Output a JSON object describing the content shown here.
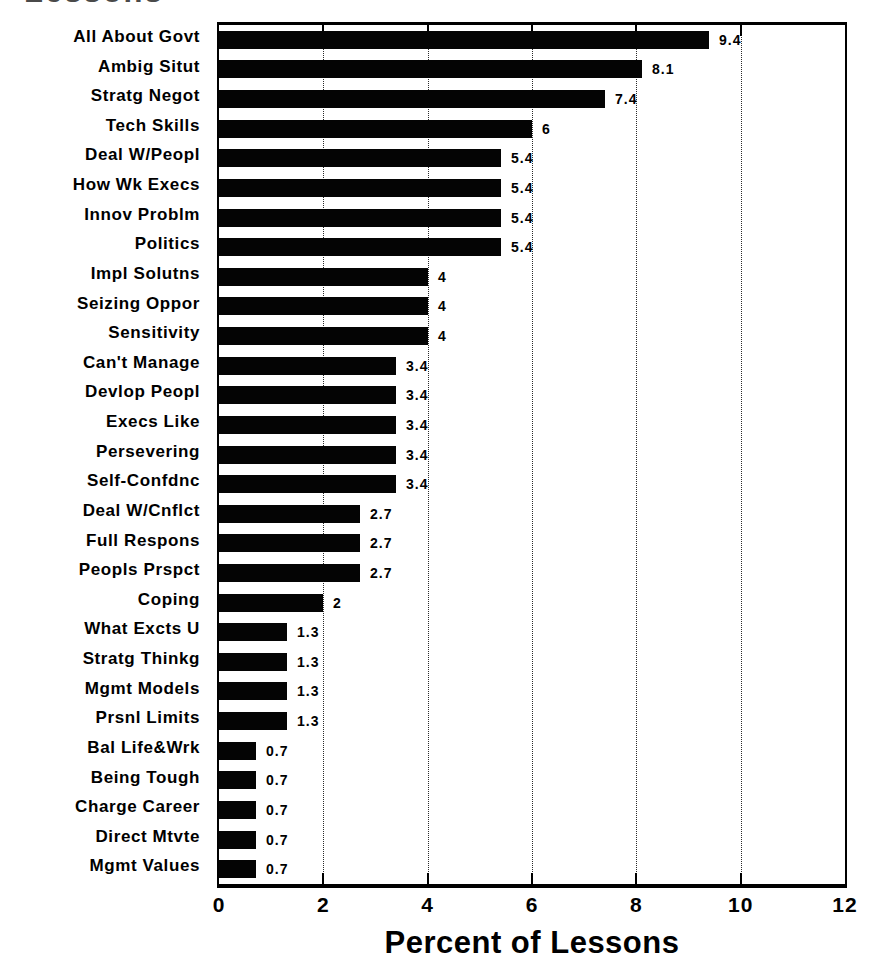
{
  "chart_data": {
    "type": "bar",
    "orientation": "horizontal",
    "title": "Lessons",
    "xlabel": "Percent of Lessons",
    "ylabel": "",
    "xlim": [
      0,
      12
    ],
    "x_ticks": [
      "0",
      "2",
      "4",
      "6",
      "8",
      "10",
      "12"
    ],
    "x_tick_values": [
      0,
      2,
      4,
      6,
      8,
      10,
      12
    ],
    "gridline_values": [
      2,
      4,
      6,
      8,
      10
    ],
    "grid": true,
    "legend": "none",
    "bar_color": "#040404",
    "background_color": "#ffffff",
    "text_color": "#000000",
    "categories": [
      "All About Govt",
      "Ambig Situt",
      "Stratg Negot",
      "Tech Skills",
      "Deal W/Peopl",
      "How Wk Execs",
      "Innov Problm",
      "Politics",
      "Impl Solutns",
      "Seizing Oppor",
      "Sensitivity",
      "Can't Manage",
      "Devlop Peopl",
      "Execs Like",
      "Persevering",
      "Self-Confdnc",
      "Deal W/Cnflct",
      "Full Respons",
      "Peopls Prspct",
      "Coping",
      "What Excts U",
      "Stratg Thinkg",
      "Mgmt Models",
      "Prsnl Limits",
      "Bal Life&Wrk",
      "Being Tough",
      "Charge Career",
      "Direct Mtvte",
      "Mgmt Values"
    ],
    "values": [
      9.4,
      8.1,
      7.4,
      6,
      5.4,
      5.4,
      5.4,
      5.4,
      4,
      4,
      4,
      3.4,
      3.4,
      3.4,
      3.4,
      3.4,
      2.7,
      2.7,
      2.7,
      2,
      1.3,
      1.3,
      1.3,
      1.3,
      0.7,
      0.7,
      0.7,
      0.7,
      0.7
    ],
    "value_labels": [
      "9.4",
      "8.1",
      "7.4",
      "6",
      "5.4",
      "5.4",
      "5.4",
      "5.4",
      "4",
      "4",
      "4",
      "3.4",
      "3.4",
      "3.4",
      "3.4",
      "3.4",
      "2.7",
      "2.7",
      "2.7",
      "2",
      "1.3",
      "1.3",
      "1.3",
      "1.3",
      "0.7",
      "0.7",
      "0.7",
      "0.7",
      "0.7"
    ]
  }
}
